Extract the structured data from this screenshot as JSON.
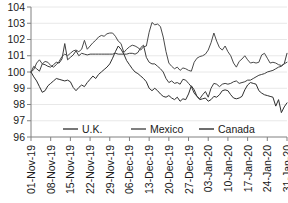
{
  "chart_data": {
    "type": "line",
    "title": "",
    "xlabel": "",
    "ylabel": "",
    "ylim": [
      96,
      104
    ],
    "ytick_step": 1,
    "yticks": [
      "96",
      "97",
      "98",
      "99",
      "100",
      "101",
      "102",
      "103",
      "104"
    ],
    "grid": true,
    "grid_axis": "y",
    "legend_position": "inside-bottom-center",
    "x_tick_labels": [
      "01-Nov-19",
      "08-Nov-19",
      "15-Nov-19",
      "22-Nov-19",
      "29-Nov-19",
      "06-Dec-19",
      "13-Dec-19",
      "20-Dec-19",
      "27-Dec-19",
      "03-Jan-20",
      "10-Jan-20",
      "17-Jan-20",
      "24-Jan-20",
      "31-Jan-20"
    ],
    "x_tick_index": [
      0,
      7,
      14,
      21,
      28,
      35,
      42,
      49,
      56,
      63,
      70,
      77,
      84,
      91
    ],
    "x_count": 92,
    "series": [
      {
        "name": "U.K.",
        "color": "#3d3d3d",
        "values": [
          100.0,
          100.35,
          100.2,
          100.05,
          100.5,
          100.45,
          100.35,
          100.3,
          100.45,
          100.6,
          100.55,
          100.8,
          101.75,
          100.75,
          100.9,
          101.05,
          101.3,
          101.0,
          101.15,
          101.1,
          101.05,
          101.1,
          101.1,
          101.1,
          101.1,
          101.1,
          101.1,
          101.1,
          101.1,
          101.1,
          101.15,
          101.1,
          101.1,
          101.1,
          101.1,
          101.15,
          101.15,
          101.1,
          101.2,
          101.5,
          101.65,
          100.9,
          100.6,
          100.5,
          100.5,
          100.35,
          100.2,
          100.0,
          99.6,
          99.35,
          99.45,
          99.3,
          99.35,
          99.25,
          99.55,
          99.5,
          99.3,
          99.1,
          98.7,
          98.5,
          98.35,
          98.6,
          98.8,
          98.45,
          99.0,
          99.3,
          99.25,
          99.1,
          99.25,
          99.3,
          99.25,
          99.3,
          99.4,
          99.45,
          99.3,
          99.35,
          99.4,
          99.5,
          99.5,
          99.6,
          99.7,
          99.8,
          99.85,
          99.9,
          100.0,
          100.05,
          100.1,
          100.2,
          100.3,
          100.35,
          100.5,
          101.15
        ]
      },
      {
        "name": "Mexico",
        "color": "#4a4a4a",
        "values": [
          100.0,
          100.15,
          100.55,
          100.75,
          100.5,
          100.65,
          100.6,
          100.4,
          100.3,
          100.45,
          100.65,
          100.95,
          101.1,
          101.0,
          101.15,
          101.3,
          101.35,
          101.25,
          101.4,
          101.95,
          101.4,
          101.6,
          101.8,
          101.95,
          102.15,
          102.25,
          102.2,
          102.35,
          102.4,
          102.4,
          102.2,
          101.9,
          101.75,
          101.2,
          101.4,
          101.55,
          101.65,
          101.6,
          101.5,
          101.35,
          101.55,
          101.6,
          102.45,
          103.05,
          102.9,
          102.95,
          102.8,
          102.15,
          101.25,
          100.55,
          100.35,
          100.2,
          100.3,
          100.1,
          100.25,
          100.2,
          100.1,
          100.05,
          100.6,
          100.85,
          100.95,
          101.0,
          101.1,
          101.35,
          101.8,
          102.4,
          101.9,
          101.5,
          101.35,
          101.6,
          101.25,
          101.0,
          100.55,
          100.3,
          100.65,
          100.8,
          101.0,
          100.75,
          100.55,
          100.6,
          100.55,
          100.6,
          101.05,
          101.15,
          100.85,
          100.55,
          100.6,
          100.55,
          100.45,
          100.4,
          100.5,
          100.6
        ]
      },
      {
        "name": "Canada",
        "color": "#2e2e2e",
        "values": [
          100.0,
          99.7,
          99.45,
          99.1,
          98.75,
          98.85,
          99.15,
          99.3,
          99.45,
          99.6,
          99.55,
          99.5,
          99.45,
          99.5,
          99.4,
          99.05,
          98.85,
          99.05,
          99.2,
          99.1,
          99.35,
          99.55,
          99.75,
          99.6,
          99.85,
          100.0,
          100.15,
          100.3,
          100.5,
          100.85,
          101.25,
          101.6,
          101.4,
          101.1,
          100.7,
          100.45,
          100.2,
          100.0,
          99.9,
          99.75,
          99.6,
          99.4,
          99.0,
          98.85,
          99.0,
          98.85,
          98.65,
          98.5,
          98.45,
          98.55,
          98.4,
          98.3,
          98.45,
          98.2,
          98.35,
          98.3,
          98.65,
          99.15,
          98.9,
          98.5,
          98.3,
          98.35,
          98.4,
          98.2,
          98.3,
          98.5,
          98.45,
          98.6,
          98.85,
          98.9,
          98.85,
          98.6,
          98.4,
          98.35,
          98.4,
          98.5,
          98.9,
          99.2,
          99.35,
          99.3,
          99.25,
          98.85,
          98.7,
          98.6,
          98.55,
          98.5,
          98.45,
          97.9,
          98.3,
          97.5,
          97.85,
          98.1
        ]
      }
    ]
  },
  "legend": {
    "items": [
      {
        "label": "U.K."
      },
      {
        "label": "Mexico"
      },
      {
        "label": "Canada"
      }
    ]
  }
}
